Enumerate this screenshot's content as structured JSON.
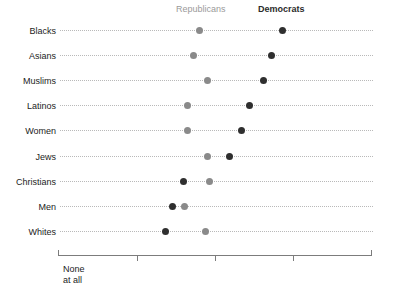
{
  "legend": {
    "republicans": "Republicans",
    "democrats": "Democrats",
    "republican_color": "#8a8a8a",
    "democrat_color": "#2f2f2f"
  },
  "axis": {
    "left_label_line1": "None",
    "left_label_line2": "at all",
    "right_label_line1": "A great",
    "right_label_line2": "deal"
  },
  "rows": [
    {
      "label": "Blacks",
      "rep": 199,
      "dem": 282
    },
    {
      "label": "Asians",
      "rep": 193,
      "dem": 271
    },
    {
      "label": "Muslims",
      "rep": 207,
      "dem": 263
    },
    {
      "label": "Latinos",
      "rep": 187,
      "dem": 249
    },
    {
      "label": "Women",
      "rep": 187,
      "dem": 241
    },
    {
      "label": "Jews",
      "rep": 207,
      "dem": 229
    },
    {
      "label": "Christians",
      "rep": 209,
      "dem": 183
    },
    {
      "label": "Men",
      "rep": 184,
      "dem": 172
    },
    {
      "label": "Whites",
      "rep": 205,
      "dem": 165
    }
  ],
  "chart_data": {
    "type": "scatter",
    "title": "",
    "subtitle": "",
    "xlabel": "",
    "ylabel": "",
    "grid": false,
    "legend_position": "top",
    "xlim": [
      0,
      100
    ],
    "xtick_labels": [
      "None at all",
      "",
      "",
      "",
      "A great deal"
    ],
    "categories": [
      "Blacks",
      "Asians",
      "Muslims",
      "Latinos",
      "Women",
      "Jews",
      "Christians",
      "Men",
      "Whites"
    ],
    "series": [
      {
        "name": "Republicans",
        "color": "#8a8a8a",
        "values": [
          45.0,
          43.1,
          47.6,
          41.2,
          41.2,
          47.6,
          48.2,
          40.3,
          47.0
        ]
      },
      {
        "name": "Democrats",
        "color": "#2f2f2f",
        "values": [
          71.6,
          68.1,
          65.5,
          61.0,
          58.5,
          54.6,
          39.9,
          36.4,
          34.2
        ]
      }
    ],
    "annotations": []
  }
}
